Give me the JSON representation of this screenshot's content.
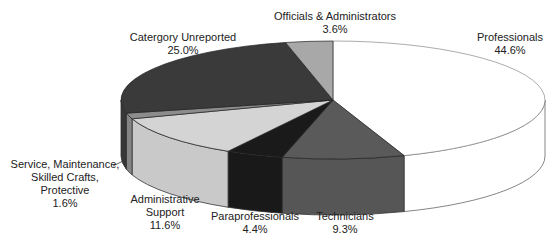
{
  "chart_data": {
    "type": "pie",
    "style": "3d",
    "title": "",
    "start_angle_deg": 0,
    "direction": "clockwise",
    "slices": [
      {
        "label": "Professionals",
        "value": 44.6,
        "display": "44.6%",
        "color": "#ffffff"
      },
      {
        "label": "Technicians",
        "value": 9.3,
        "display": "9.3%",
        "color": "#5a5a5a"
      },
      {
        "label": "Paraprofessionals",
        "value": 4.4,
        "display": "4.4%",
        "color": "#1a1a1a"
      },
      {
        "label": "Administrative Support",
        "value": 11.6,
        "display": "11.6%",
        "color": "#d4d4d4"
      },
      {
        "label": "Service, Maintenance, Skilled Crafts, Protective",
        "value": 1.6,
        "display": "1.6%",
        "color": "#8c8c8c"
      },
      {
        "label": "Catergory Unreported",
        "value": 25.0,
        "display": "25.0%",
        "color": "#3a3a3a"
      },
      {
        "label": "Officials & Administrators",
        "value": 3.6,
        "display": "3.6%",
        "color": "#a8a8a8"
      }
    ]
  },
  "labels": {
    "professionals": {
      "name": "Professionals",
      "pct": "44.6%"
    },
    "technicians": {
      "name": "Technicians",
      "pct": "9.3%"
    },
    "paraprofessionals": {
      "name": "Paraprofessionals",
      "pct": "4.4%"
    },
    "admin_support": {
      "line1": "Administrative",
      "line2": "Support",
      "pct": "11.6%"
    },
    "service": {
      "line1": "Service, Maintenance,",
      "line2": "Skilled Crafts,",
      "line3": "Protective",
      "pct": "1.6%"
    },
    "unreported": {
      "name": "Catergory Unreported",
      "pct": "25.0%"
    },
    "officials": {
      "name": "Officials & Administrators",
      "pct": "3.6%"
    }
  }
}
